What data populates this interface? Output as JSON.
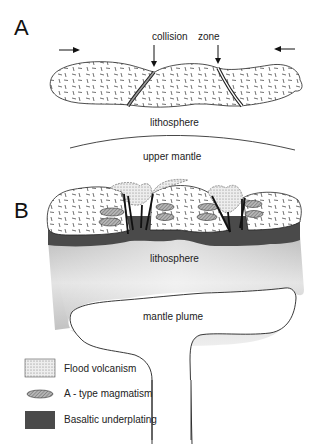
{
  "panels": {
    "a": {
      "label": "A",
      "annotations": {
        "collision": "collision",
        "zone": "zone",
        "lithosphere": "lithosphere",
        "upper_mantle": "upper mantle"
      }
    },
    "b": {
      "label": "B",
      "annotations": {
        "lithosphere": "lithosphere",
        "mantle_plume": "mantle plume"
      }
    }
  },
  "legend": [
    {
      "key": "flood",
      "label": "Flood volcanism"
    },
    {
      "key": "atype",
      "label": "A - type magmatism"
    },
    {
      "key": "basalt",
      "label": "Basaltic underplating"
    }
  ],
  "colors": {
    "basalt": "#4a4a4a",
    "ellipse": "#9a9a9a",
    "flood": "#e2e2e2",
    "litho_dark": "#a8a8a8",
    "line": "#222222"
  }
}
